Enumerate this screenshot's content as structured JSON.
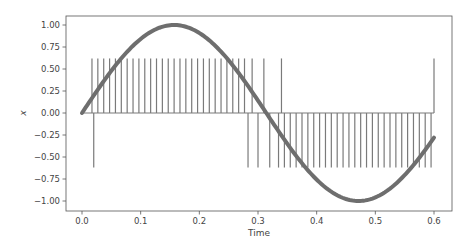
{
  "chart_data": {
    "type": "line",
    "title": "",
    "xlabel": "Time",
    "ylabel": "x",
    "xlim": [
      -0.03,
      0.63
    ],
    "ylim": [
      -1.1,
      1.1
    ],
    "grid": false,
    "legend": null,
    "x_ticks": [
      "0.0",
      "0.1",
      "0.2",
      "0.3",
      "0.4",
      "0.5",
      "0.6"
    ],
    "x_tick_values": [
      0.0,
      0.1,
      0.2,
      0.3,
      0.4,
      0.5,
      0.6
    ],
    "y_ticks": [
      "1.00",
      "0.75",
      "0.50",
      "0.25",
      "0.00",
      "−0.25",
      "−0.50",
      "−0.75",
      "−1.00"
    ],
    "y_tick_values": [
      1.0,
      0.75,
      0.5,
      0.25,
      0.0,
      -0.25,
      -0.5,
      -0.75,
      -1.0
    ],
    "series": [
      {
        "name": "sine input",
        "style": "thick line",
        "color": "#6e6e6e",
        "function": "sin(10*t)",
        "t_range": [
          0.0,
          0.6
        ]
      },
      {
        "name": "spike train",
        "style": "stems",
        "color": "#7a7a7a",
        "baseline": 0.0,
        "amplitude": 0.62,
        "positive_spike_times": [
          0.017,
          0.027,
          0.037,
          0.047,
          0.057,
          0.067,
          0.077,
          0.087,
          0.097,
          0.107,
          0.117,
          0.127,
          0.137,
          0.147,
          0.157,
          0.167,
          0.177,
          0.187,
          0.197,
          0.207,
          0.217,
          0.227,
          0.237,
          0.247,
          0.257,
          0.267,
          0.277,
          0.29,
          0.31,
          0.34,
          0.6
        ],
        "negative_spike_times": [
          0.02,
          0.283,
          0.3,
          0.32,
          0.335,
          0.345,
          0.355,
          0.365,
          0.375,
          0.385,
          0.395,
          0.405,
          0.415,
          0.425,
          0.435,
          0.445,
          0.455,
          0.465,
          0.475,
          0.485,
          0.495,
          0.505,
          0.515,
          0.525,
          0.535,
          0.545,
          0.555,
          0.565,
          0.575,
          0.585,
          0.595
        ]
      }
    ]
  }
}
